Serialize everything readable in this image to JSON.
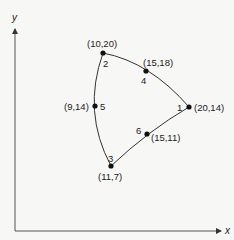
{
  "axes": {
    "x_label": "x",
    "y_label": "y"
  },
  "nodes": [
    {
      "id": "1",
      "coord": "(20,14)",
      "px": 189,
      "py": 107
    },
    {
      "id": "2",
      "coord": "(10,20)",
      "px": 103,
      "py": 53
    },
    {
      "id": "3",
      "coord": "(11,7)",
      "px": 111,
      "py": 166
    },
    {
      "id": "4",
      "coord": "(15,18)",
      "px": 146,
      "py": 71
    },
    {
      "id": "5",
      "coord": "(9,14)",
      "px": 95,
      "py": 106
    },
    {
      "id": "6",
      "coord": "(15,11)",
      "px": 147,
      "py": 134
    }
  ],
  "edges": [
    {
      "from": "2",
      "via": "4",
      "to": "1"
    },
    {
      "from": "1",
      "via": "6",
      "to": "3"
    },
    {
      "from": "3",
      "via": "5",
      "to": "2"
    }
  ],
  "colors": {
    "line": "#333333",
    "node": "#111111",
    "background": "#f7f7f5"
  }
}
